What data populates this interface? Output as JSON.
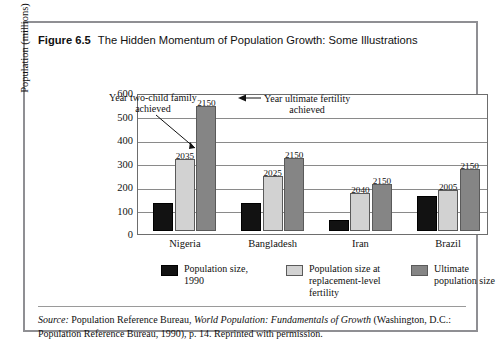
{
  "figure": {
    "number": "Figure 6.5",
    "title": "The Hidden Momentum of Population Growth: Some Illustrations"
  },
  "annotations": {
    "left_line1": "Year two-child family",
    "left_line2": "achieved",
    "right_line1": "Year ultimate fertility",
    "right_line2": "achieved"
  },
  "legend": {
    "items": [
      {
        "label_line1": "Population size,",
        "label_line2": "1990",
        "color": "#121212"
      },
      {
        "label_line1": "Population size at",
        "label_line2": "replacement-level",
        "label_line3": "fertility",
        "color": "#d2d2d2"
      },
      {
        "label_line1": "Ultimate",
        "label_line2": "population size",
        "color": "#858585"
      }
    ]
  },
  "source": {
    "prefix": "Source:",
    "text_before_italic": " Population Reference Bureau, ",
    "italic_title": "World Population: Fundamentals of Growth",
    "text_after": " (Washington, D.C.: Population Reference Bureau, 1990), p. 14. Reprinted with permission."
  },
  "chart_data": {
    "type": "bar",
    "title": "The Hidden Momentum of Population Growth: Some Illustrations",
    "xlabel": "",
    "ylabel": "Population (millions)",
    "ylim": [
      0,
      600
    ],
    "yticks": [
      0,
      100,
      200,
      300,
      400,
      500,
      600
    ],
    "grid": true,
    "legend_position": "bottom",
    "categories": [
      "Nigeria",
      "Bangladesh",
      "Iran",
      "Brazil"
    ],
    "series": [
      {
        "name": "Population size, 1990",
        "color": "#121212",
        "values": [
          120,
          120,
          45,
          150
        ]
      },
      {
        "name": "Population size at replacement-level fertility",
        "color": "#d2d2d2",
        "values": [
          305,
          235,
          160,
          175
        ]
      },
      {
        "name": "Ultimate population size",
        "color": "#858585",
        "values": [
          530,
          310,
          200,
          265
        ]
      }
    ],
    "point_labels": [
      {
        "category": "Nigeria",
        "series": "Population size at replacement-level fertility",
        "label": "2035"
      },
      {
        "category": "Nigeria",
        "series": "Ultimate population size",
        "label": "2150"
      },
      {
        "category": "Bangladesh",
        "series": "Population size at replacement-level fertility",
        "label": "2025"
      },
      {
        "category": "Bangladesh",
        "series": "Ultimate population size",
        "label": "2150"
      },
      {
        "category": "Iran",
        "series": "Population size at replacement-level fertility",
        "label": "2040"
      },
      {
        "category": "Iran",
        "series": "Ultimate population size",
        "label": "2150"
      },
      {
        "category": "Brazil",
        "series": "Population size at replacement-level fertility",
        "label": "2005"
      },
      {
        "category": "Brazil",
        "series": "Ultimate population size",
        "label": "2150"
      }
    ]
  }
}
